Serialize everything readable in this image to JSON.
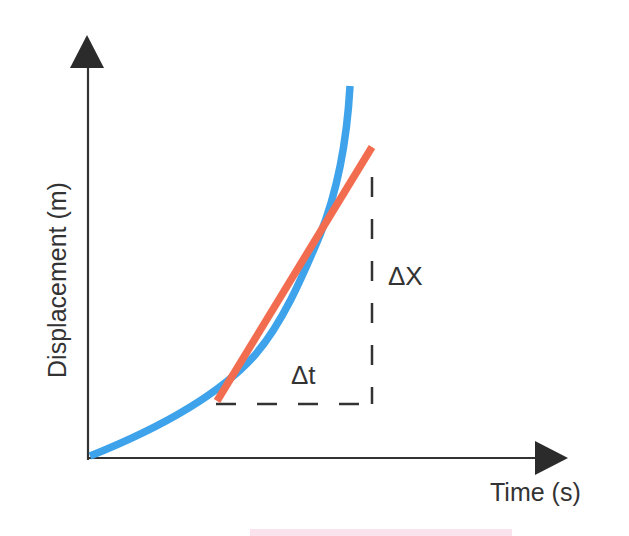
{
  "diagram": {
    "type": "displacement-time graph with tangent",
    "y_axis_label": "Displacement (m)",
    "x_axis_label": "Time (s)",
    "delta_x_label": "ΔX",
    "delta_t_label": "Δt",
    "colors": {
      "axes": "#333333",
      "curve": "#3ea3ea",
      "tangent": "#f26d50",
      "dashes": "#333333",
      "text": "#333333"
    },
    "elements": [
      {
        "name": "displacement-curve",
        "description": "Blue upward-curving (accelerating) displacement vs time curve starting at origin"
      },
      {
        "name": "tangent-line",
        "description": "Orange straight tangent line touching the curve, representing instantaneous velocity"
      },
      {
        "name": "slope-triangle",
        "description": "Dashed right-triangle legs showing Δt (horizontal) and ΔX (vertical) for the tangent slope"
      }
    ]
  }
}
